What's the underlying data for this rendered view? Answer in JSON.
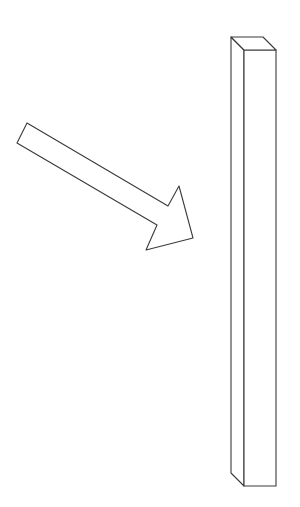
{
  "figure": {
    "colors": {
      "background": "#ffffff",
      "line": "#3a3a3a"
    },
    "arrow": {
      "points": [
        [
          27,
          123
        ],
        [
          168,
          206
        ],
        [
          179,
          186
        ],
        [
          193,
          238
        ],
        [
          146,
          250
        ],
        [
          157,
          225
        ],
        [
          17,
          143
        ]
      ]
    },
    "prism": {
      "top_face": [
        [
          231,
          37
        ],
        [
          263,
          37
        ],
        [
          276,
          50
        ],
        [
          244,
          50
        ]
      ],
      "side_face": [
        [
          231,
          37
        ],
        [
          244,
          50
        ],
        [
          244,
          486
        ],
        [
          231,
          473
        ]
      ],
      "front_face": [
        [
          244,
          50
        ],
        [
          276,
          50
        ],
        [
          276,
          486
        ],
        [
          244,
          486
        ]
      ]
    }
  }
}
